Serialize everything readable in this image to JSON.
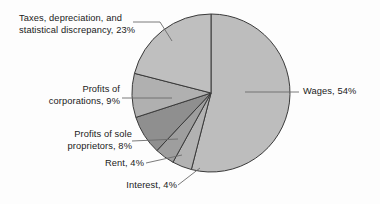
{
  "chart_data": {
    "type": "pie",
    "title": "",
    "start_angle_deg": 0,
    "direction": "clockwise",
    "grid": false,
    "legend_position": "none",
    "labels_with_leader_lines": true,
    "unit": "percent",
    "categories": [
      "Wages",
      "Interest",
      "Rent",
      "Profits of sole proprietors",
      "Profits of corporations",
      "Taxes, depreciation, and statistical discrepancy"
    ],
    "values": [
      54,
      4,
      4,
      8,
      9,
      23
    ],
    "slices": [
      {
        "name": "wages",
        "label": "Wages, 54%",
        "value": 54,
        "color": "#bdbdbd",
        "start_deg": 0,
        "end_deg": 194.4
      },
      {
        "name": "interest",
        "label": "Interest, 4%",
        "value": 4,
        "color": "#b2b2b2",
        "start_deg": 194.4,
        "end_deg": 208.8
      },
      {
        "name": "rent",
        "label": "Rent, 4%",
        "value": 4,
        "color": "#9e9e9e",
        "start_deg": 208.8,
        "end_deg": 223.2
      },
      {
        "name": "sole-proprietors",
        "label": "Profits of sole proprietors, 8%",
        "value": 8,
        "color": "#8f8f8f",
        "start_deg": 223.2,
        "end_deg": 252.0
      },
      {
        "name": "corporations",
        "label": "Profits of corporations, 9%",
        "value": 9,
        "color": "#b0b0b0",
        "start_deg": 252.0,
        "end_deg": 284.4
      },
      {
        "name": "taxes",
        "label": "Taxes, depreciation, and statistical discrepancy, 23%",
        "value": 23,
        "color": "#bfbfbf",
        "start_deg": 284.4,
        "end_deg": 360.0
      }
    ]
  },
  "labels": {
    "taxes_line1": "Taxes, depreciation, and",
    "taxes_line2": "statistical discrepancy, 23%",
    "corporations_line1": "Profits of",
    "corporations_line2": "corporations, 9%",
    "sole_line1": "Profits of sole",
    "sole_line2": "proprietors, 8%",
    "rent": "Rent, 4%",
    "interest": "Interest, 4%",
    "wages": "Wages, 54%"
  },
  "colors": {
    "background": "#fdfdfd",
    "slice_outline": "#3a3a3a",
    "leader_line": "#6b6b6b",
    "text": "#1a1a1a"
  }
}
